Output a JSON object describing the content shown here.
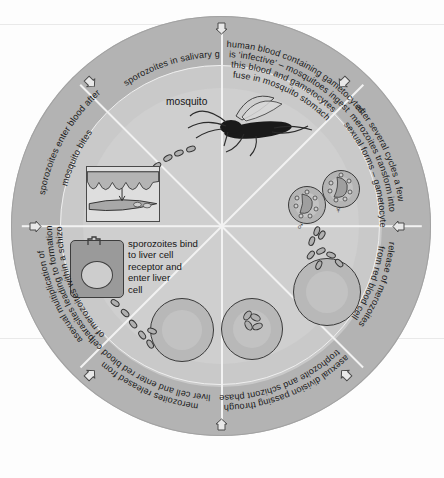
{
  "diagram": {
    "type": "circular-cycle-diagram",
    "segment_count": 8,
    "colors": {
      "page_background": "#fdfdfd",
      "outer_ring": "#b3b3b3",
      "inner_ring": "#c9c9c9",
      "core_disc": "#cfcfcf",
      "spoke_line": "#f2f2f2",
      "ink": "#1b1b1b",
      "cell_fill": "#b8b8b8",
      "liver_cell_fill": "#9a9a9a"
    }
  },
  "segments": [
    {
      "id": "gametocyte-ingestion",
      "position": "top-right",
      "text": "human blood containing gametocytes is 'infective' – mosquitoes ingest this blood and gametocytes fuse in mosquito stomach",
      "lines": [
        "human blood containing gametocytes",
        "is 'infective' – mosquitoes ingest",
        "this blood and gametocytes",
        "fuse in mosquito stomach"
      ]
    },
    {
      "id": "gametocyte-formation",
      "position": "right-upper",
      "text": "after several cycles a few merozoites transform into sexual forms – gametocytes",
      "lines": [
        "after several cycles a few",
        "merozoites transform into",
        "sexual forms – gametocytes"
      ]
    },
    {
      "id": "merozoite-release",
      "position": "right-lower",
      "text": "release of merozoites from red blood cell",
      "lines": [
        "release of merozoites",
        "from red blood cell"
      ]
    },
    {
      "id": "asexual-division",
      "position": "bottom-right",
      "text": "asexual division passing through trophozoite and schizont phases",
      "lines": [
        "asexual division passing through",
        "trophozoite and schizont phases"
      ]
    },
    {
      "id": "merozoites-enter-rbc",
      "position": "bottom-left",
      "text": "merozoites released from liver cell and enter red blood cell",
      "lines": [
        "merozoites released from",
        "liver cell and enter red blood cell"
      ]
    },
    {
      "id": "asexual-multiplication",
      "position": "left-lower",
      "text": "asexual multiplication of parasites leading to formation of merozoites within a schizont",
      "lines": [
        "asexual multiplication of",
        "parasites leading to formation",
        "of merozoites within a schizont"
      ]
    },
    {
      "id": "sporozoites-enter-blood",
      "position": "left-upper",
      "text": "sporozoites enter blood after mosquito bites",
      "lines": [
        "sporozoites enter blood after",
        "mosquito bites"
      ]
    },
    {
      "id": "sporozoites-salivary-gland",
      "position": "top-left",
      "text": "sporozoites in salivary gland",
      "lines": [
        "sporozoites in salivary gland"
      ]
    }
  ],
  "inner_labels": {
    "mosquito": "mosquito",
    "liver_binding": "sporozoites bind\nto liver cell\nreceptor and\nenter liver\ncell"
  },
  "symbols": {
    "male": "♂",
    "female": "♀"
  },
  "illustrations": [
    {
      "id": "mosquito",
      "name": "mosquito-illustration",
      "caption": "mosquito"
    },
    {
      "id": "skin-vessel",
      "name": "skin-and-blood-vessel-illustration",
      "caption": ""
    },
    {
      "id": "liver-cell",
      "name": "liver-cell-illustration",
      "caption": ""
    },
    {
      "id": "red-blood-cell-entry",
      "name": "red-blood-cell-with-merozoite",
      "caption": ""
    },
    {
      "id": "red-blood-cell-schizont",
      "name": "red-blood-cell-with-schizont",
      "caption": ""
    },
    {
      "id": "red-blood-cell-burst",
      "name": "bursting-red-blood-cell",
      "caption": ""
    },
    {
      "id": "gametocyte-male",
      "name": "male-gametocyte",
      "caption": "♂"
    },
    {
      "id": "gametocyte-female",
      "name": "female-gametocyte",
      "caption": "♀"
    }
  ]
}
